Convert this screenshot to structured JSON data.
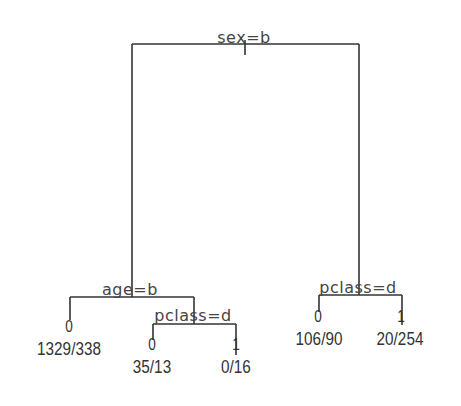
{
  "diagram": {
    "type": "decision-tree",
    "line_color": "#333333",
    "background": "#ffffff",
    "root": {
      "split": "sex=b",
      "left": {
        "split": "age=b",
        "left": {
          "class": "0",
          "counts": "1329/338"
        },
        "right": {
          "split": "pclass=d",
          "left": {
            "class": "0",
            "counts": "35/13"
          },
          "right": {
            "class": "1",
            "counts": "0/16"
          }
        }
      },
      "right": {
        "split": "pclass=d",
        "left": {
          "class": "0",
          "counts": "106/90"
        },
        "right": {
          "class": "1",
          "counts": "20/254"
        }
      }
    }
  }
}
